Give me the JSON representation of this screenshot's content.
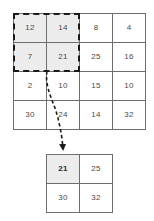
{
  "diagram": {
    "colors": {
      "grid_line": "#6e6e6e",
      "cell_text": "#4a4a4a",
      "cell_shaded_bg": "#ececec",
      "cell_bg": "#ffffff",
      "selection_border": "#1a1a1a",
      "connector": "#1a1a1a"
    },
    "input_grid": {
      "name": "input-feature-map",
      "rows": 4,
      "cols": 4,
      "cells": [
        {
          "value": "12",
          "shaded": true,
          "bold": false
        },
        {
          "value": "14",
          "shaded": true,
          "bold": false
        },
        {
          "value": "8",
          "shaded": false,
          "bold": false
        },
        {
          "value": "4",
          "shaded": false,
          "bold": false
        },
        {
          "value": "7",
          "shaded": true,
          "bold": false
        },
        {
          "value": "21",
          "shaded": true,
          "bold": false
        },
        {
          "value": "25",
          "shaded": false,
          "bold": false
        },
        {
          "value": "16",
          "shaded": false,
          "bold": false
        },
        {
          "value": "2",
          "shaded": false,
          "bold": false
        },
        {
          "value": "10",
          "shaded": false,
          "bold": false
        },
        {
          "value": "15",
          "shaded": false,
          "bold": false
        },
        {
          "value": "10",
          "shaded": false,
          "bold": false
        },
        {
          "value": "30",
          "shaded": false,
          "bold": false
        },
        {
          "value": "24",
          "shaded": false,
          "bold": false
        },
        {
          "value": "14",
          "shaded": false,
          "bold": false
        },
        {
          "value": "32",
          "shaded": false,
          "bold": false
        }
      ]
    },
    "output_grid": {
      "name": "output-feature-map",
      "rows": 2,
      "cols": 2,
      "cells": [
        {
          "value": "21",
          "shaded": true,
          "bold": true
        },
        {
          "value": "25",
          "shaded": false,
          "bold": false
        },
        {
          "value": "30",
          "shaded": false,
          "bold": false
        },
        {
          "value": "32",
          "shaded": false,
          "bold": false
        }
      ]
    },
    "selection_window": {
      "name": "pooling-window",
      "covers_rows": 2,
      "covers_cols": 2,
      "style": "dashed"
    },
    "connector": {
      "name": "pooling-result-arrow",
      "style": "dashed",
      "from": "pooling-window-bottom-left",
      "to": "output-cell-0-0"
    }
  }
}
